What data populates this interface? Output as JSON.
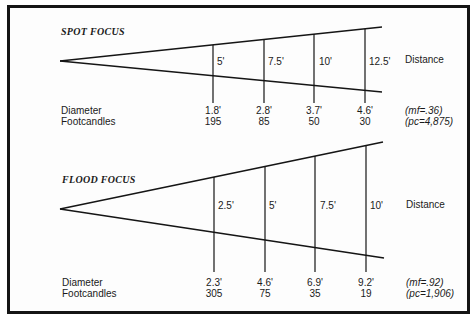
{
  "colors": {
    "line": "#151515",
    "text": "#1a1a1a",
    "background": "#fdfdfd"
  },
  "sections": [
    {
      "title": "SPOT FOCUS",
      "distance_label": "Distance",
      "diameter_label": "Diameter",
      "footcandles_label": "Footcandles",
      "distances": [
        "5'",
        "7.5'",
        "10'",
        "12.5'"
      ],
      "diameters": [
        "1.8'",
        "2.8'",
        "3.7'",
        "4.6'"
      ],
      "footcandles": [
        "195",
        "85",
        "50",
        "30"
      ],
      "mf_note": "(mf=.36)",
      "pc_note": "(pc=4,875)"
    },
    {
      "title": "FLOOD FOCUS",
      "distance_label": "Distance",
      "diameter_label": "Diameter",
      "footcandles_label": "Footcandles",
      "distances": [
        "2.5'",
        "5'",
        "7.5'",
        "10'"
      ],
      "diameters": [
        "2.3'",
        "4.6'",
        "6.9'",
        "9.2'"
      ],
      "footcandles": [
        "305",
        "75",
        "35",
        "19"
      ],
      "mf_note": "(mf=.92)",
      "pc_note": "(pc=1,906)"
    }
  ]
}
